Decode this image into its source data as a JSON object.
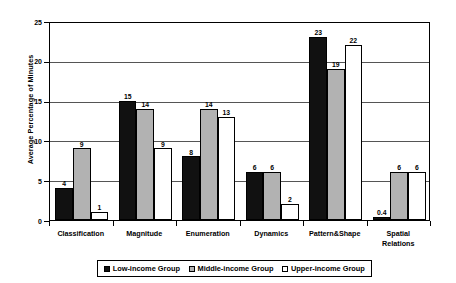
{
  "chart_data": {
    "type": "bar",
    "title": "",
    "xlabel": "",
    "ylabel": "Average Percentage of Minutes",
    "ylim": [
      0,
      25
    ],
    "yticks": [
      0,
      5,
      10,
      15,
      20,
      25
    ],
    "grid": true,
    "legend_position": "bottom",
    "categories": [
      "Classification",
      "Magnitude",
      "Enumeration",
      "Dynamics",
      "Pattern&Shape",
      "Spatial\nRelations"
    ],
    "series": [
      {
        "name": "Low-income Group",
        "color": "#111111",
        "values": [
          4,
          15,
          8,
          6,
          23,
          0.4
        ],
        "labels": [
          "4",
          "15",
          "8",
          "6",
          "23",
          "0.4"
        ]
      },
      {
        "name": "Middle-income Group",
        "color": "#b2b2b2",
        "values": [
          9,
          14,
          14,
          6,
          19,
          6
        ],
        "labels": [
          "9",
          "14",
          "14",
          "6",
          "19",
          "6"
        ]
      },
      {
        "name": "Upper-income Group",
        "color": "#ffffff",
        "values": [
          1,
          9,
          13,
          2,
          22,
          6
        ],
        "labels": [
          "1",
          "9",
          "13",
          "2",
          "22",
          "6"
        ]
      }
    ]
  },
  "axis": {
    "y_title": "Average Percentage of Minutes",
    "y_tick_labels": [
      "25",
      "20",
      "15",
      "10",
      "5",
      "0"
    ]
  },
  "legend": {
    "items": [
      {
        "label": "Low-income Group",
        "swatch": "low"
      },
      {
        "label": "Middle-income Group",
        "swatch": "middle"
      },
      {
        "label": "Upper-income Group",
        "swatch": "upper"
      }
    ]
  }
}
